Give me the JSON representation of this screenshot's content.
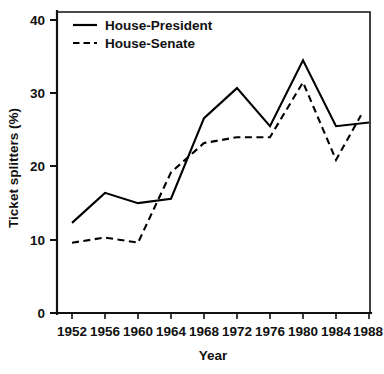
{
  "chart_data": {
    "type": "line",
    "title": "",
    "xlabel": "Year",
    "ylabel": "Ticket splitters (%)",
    "x": [
      1952,
      1956,
      1960,
      1964,
      1968,
      1972,
      1976,
      1980,
      1984,
      1988
    ],
    "xtick_labels": [
      "1952",
      "1956",
      "1960",
      "1964",
      "1968",
      "1972",
      "1976",
      "1980",
      "1984",
      "1988"
    ],
    "ytick_labels": [
      "0",
      "10",
      "20",
      "30",
      "40"
    ],
    "yticks": [
      0,
      10,
      20,
      30,
      40
    ],
    "xlim": [
      1950,
      1989
    ],
    "ylim": [
      0,
      41
    ],
    "grid": false,
    "legend_position": "top-left",
    "series": [
      {
        "name": "House-President",
        "style": "solid",
        "color": "#000000",
        "values": [
          12.3,
          16.4,
          15.0,
          15.6,
          26.6,
          30.7,
          25.5,
          34.5,
          25.5,
          26.0
        ]
      },
      {
        "name": "House-Senate",
        "style": "dashed",
        "color": "#000000",
        "values": [
          9.6,
          10.3,
          9.6,
          19.2,
          23.2,
          24.0,
          24.0,
          31.5,
          20.9,
          27.0
        ]
      }
    ]
  },
  "axes": {
    "y_title": "Ticket splitters (%)",
    "x_title": "Year"
  },
  "legend": {
    "entries": [
      {
        "label": "House-President",
        "style": "solid"
      },
      {
        "label": "House-Senate",
        "style": "dashed"
      }
    ]
  }
}
